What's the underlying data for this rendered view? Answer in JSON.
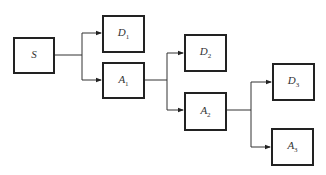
{
  "diagram": {
    "type": "decision-tree",
    "nodes": [
      {
        "id": "S",
        "letter": "S",
        "sub": "",
        "x": 13,
        "y": 37,
        "w": 42,
        "h": 37
      },
      {
        "id": "D1",
        "letter": "D",
        "sub": "1",
        "x": 102,
        "y": 15,
        "w": 43,
        "h": 38
      },
      {
        "id": "A1",
        "letter": "A",
        "sub": "1",
        "x": 102,
        "y": 62,
        "w": 43,
        "h": 37
      },
      {
        "id": "D2",
        "letter": "D",
        "sub": "2",
        "x": 184,
        "y": 34,
        "w": 43,
        "h": 38
      },
      {
        "id": "A2",
        "letter": "A",
        "sub": "2",
        "x": 184,
        "y": 92,
        "w": 43,
        "h": 39
      },
      {
        "id": "D3",
        "letter": "D",
        "sub": "3",
        "x": 272,
        "y": 63,
        "w": 43,
        "h": 38
      },
      {
        "id": "A3",
        "letter": "A",
        "sub": "3",
        "x": 271,
        "y": 128,
        "w": 43,
        "h": 38
      }
    ],
    "edges": [
      {
        "from": "S",
        "to": "D1"
      },
      {
        "from": "S",
        "to": "A1"
      },
      {
        "from": "A1",
        "to": "D2"
      },
      {
        "from": "A1",
        "to": "A2"
      },
      {
        "from": "A2",
        "to": "D3"
      },
      {
        "from": "A2",
        "to": "A3"
      }
    ],
    "colors": {
      "line": "#333333",
      "border": "#222222",
      "text": "#333333"
    }
  },
  "labels": {
    "S": {
      "main": "S",
      "sub": ""
    },
    "D1": {
      "main": "D",
      "sub": "1"
    },
    "A1": {
      "main": "A",
      "sub": "1"
    },
    "D2": {
      "main": "D",
      "sub": "2"
    },
    "A2": {
      "main": "A",
      "sub": "2"
    },
    "D3": {
      "main": "D",
      "sub": "3"
    },
    "A3": {
      "main": "A",
      "sub": "3"
    }
  }
}
